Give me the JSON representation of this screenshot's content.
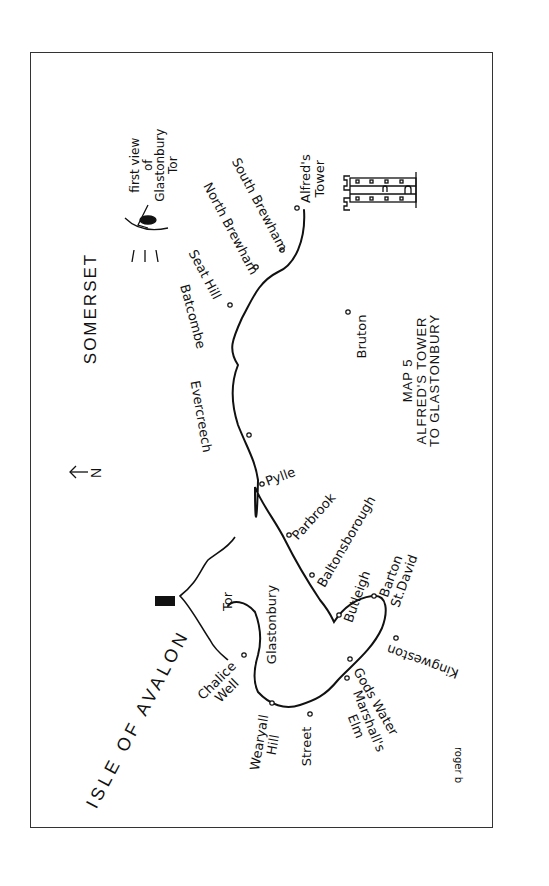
{
  "map": {
    "title_lines": [
      "MAP 5",
      "ALFRED'S TOWER",
      "TO GLASTONBURY"
    ],
    "county": "SOMERSET",
    "region": "ISLE OF AVALON",
    "north_arrow": {
      "label": "N",
      "icon": "arrow-left-icon"
    },
    "viewpoint": {
      "lines": [
        "first view",
        "of",
        "Glastonbury",
        "Tor"
      ],
      "icon": "eye-icon"
    },
    "landmark": {
      "lines": [
        "Alfred's",
        "Tower"
      ],
      "icon": "tower-icon"
    },
    "signature": "roger b",
    "places": {
      "south_brewham": "South Brewham",
      "north_brewham": "North Brewham",
      "seat_hill": "Seat Hill",
      "batcombe": "Batcombe",
      "evercreech": "Evercreech",
      "pylle": "Pylle",
      "bruton": "Bruton",
      "parbrook": "Parbrook",
      "baltonsborough": "Baltonsborough",
      "butleigh": "Butleigh",
      "barton_st_david": [
        "Barton",
        "St.David"
      ],
      "kingweston": "Kingweston",
      "gods_water": "Gods Water",
      "marshalls_elm": [
        "Marshall's",
        "Elm"
      ],
      "street": "Street",
      "wearyall_hill": [
        "Wearyall",
        "Hill"
      ],
      "chalice_well": [
        "Chalice",
        "Well"
      ],
      "glastonbury": "Glastonbury",
      "tor": "Tor"
    },
    "colors": {
      "ink": "#111111",
      "paper": "#ffffff",
      "frame": "#333333"
    }
  }
}
